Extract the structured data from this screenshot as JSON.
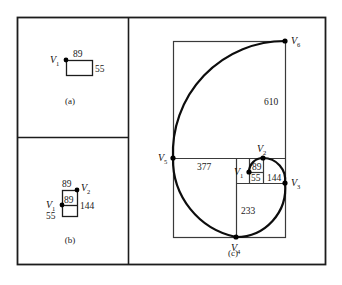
{
  "figure": {
    "kind": "fibonacci-spiral-construction",
    "frame": {
      "x": 17,
      "y": 17,
      "width": 308,
      "height": 247,
      "stroke": "#1c1c1c"
    },
    "dividers": {
      "vertical_x": 128,
      "horizontal_y": 137
    }
  },
  "panels": [
    {
      "id": "a",
      "caption": "(a)",
      "caption_pos": {
        "x": 70,
        "y": 104
      },
      "vertices": [
        {
          "label": "V",
          "sub": "1",
          "x": 66,
          "y": 60,
          "label_x": 50,
          "label_y": 63
        }
      ],
      "rect": {
        "x": 66,
        "y": 60,
        "width": 26,
        "height": 15
      },
      "labels": [
        {
          "text": "89",
          "x": 73,
          "y": 57
        },
        {
          "text": "55",
          "x": 95,
          "y": 72
        }
      ]
    },
    {
      "id": "b",
      "caption": "(b)",
      "caption_pos": {
        "x": 70,
        "y": 243
      },
      "vertices": [
        {
          "label": "V",
          "sub": "1",
          "x": 62,
          "y": 205,
          "label_x": 46,
          "label_y": 208
        },
        {
          "label": "V",
          "sub": "2",
          "x": 77,
          "y": 190,
          "label_x": 81,
          "label_y": 191
        }
      ],
      "outer_rect": {
        "x": 62,
        "y": 190,
        "width": 15,
        "height": 26
      },
      "inner_line_y": 205,
      "labels": [
        {
          "text": "89",
          "x": 62,
          "y": 187
        },
        {
          "text": "89",
          "x": 64,
          "y": 203
        },
        {
          "text": "144",
          "x": 80,
          "y": 209
        },
        {
          "text": "55",
          "x": 46,
          "y": 219
        }
      ]
    },
    {
      "id": "c",
      "caption": "(c)",
      "caption_pos": {
        "x": 233,
        "y": 256
      },
      "vertices": [
        {
          "label": "V",
          "sub": "1",
          "x": 249,
          "y": 172,
          "label_x": 234,
          "label_y": 175
        },
        {
          "label": "V",
          "sub": "2",
          "x": 263,
          "y": 158,
          "label_x": 257,
          "label_y": 152
        },
        {
          "label": "V",
          "sub": "3",
          "x": 285,
          "y": 183,
          "label_x": 291,
          "label_y": 186
        },
        {
          "label": "V",
          "sub": "4",
          "x": 236,
          "y": 237,
          "label_x": 231,
          "label_y": 251
        },
        {
          "label": "V",
          "sub": "5",
          "x": 173,
          "y": 158,
          "label_x": 158,
          "label_y": 161
        },
        {
          "label": "V",
          "sub": "6",
          "x": 285,
          "y": 41,
          "label_x": 291,
          "label_y": 44
        }
      ],
      "squares": [
        {
          "value": "89",
          "x": 249,
          "y": 158,
          "size": 14,
          "label_x": 252,
          "label_y": 170
        },
        {
          "value": "55",
          "x": 249,
          "y": 172,
          "size": 11,
          "label_x": 251,
          "label_y": 181
        },
        {
          "value": "144",
          "x": 263,
          "y": 158,
          "size": 22,
          "label_x": 267,
          "label_y": 181
        },
        {
          "value": "233",
          "x": 236,
          "y": 183,
          "size": 49,
          "label_x": 241,
          "label_y": 214
        },
        {
          "value": "377",
          "x": 173,
          "y": 158,
          "size": 79,
          "label_x": 197,
          "label_y": 170
        },
        {
          "value": "610",
          "x": 173,
          "y": 41,
          "size": 112,
          "label_x": 264,
          "label_y": 105
        }
      ],
      "outer_rect": {
        "x": 173,
        "y": 41,
        "width": 112,
        "height": 196
      },
      "grid_lines": [
        {
          "x1": 173,
          "y1": 158,
          "x2": 285,
          "y2": 158
        },
        {
          "x1": 236,
          "y1": 158,
          "x2": 236,
          "y2": 237
        },
        {
          "x1": 236,
          "y1": 183,
          "x2": 285,
          "y2": 183
        },
        {
          "x1": 249,
          "y1": 158,
          "x2": 249,
          "y2": 183
        },
        {
          "x1": 263,
          "y1": 158,
          "x2": 263,
          "y2": 183
        },
        {
          "x1": 249,
          "y1": 172,
          "x2": 263,
          "y2": 172
        }
      ],
      "spiral_path": "M 249 172 A 11 11 0 0 1 260.0 161.0 M 260.0 161.0 A 14 14 0 0 1 263 158 M 263 158 A 22 22 0 0 1 285 180 M 285 180 A 22 22 0 0 1 285 183 M 285 183 A 49 49 0 0 1 236 232 M 236 232 A 49 49 0 0 1 236 237 M 236 237 A 79 79 0 0 1 173 158 M 173 158 A 112 112 0 0 1 285 46 M 285 46 A 112 112 0 0 1 285 41"
    }
  ],
  "colors": {
    "line": "#1c1c1c",
    "thin_line": "#3a3a3a",
    "spiral": "#0d0d0d",
    "dot": "#000000",
    "background": "#ffffff"
  }
}
